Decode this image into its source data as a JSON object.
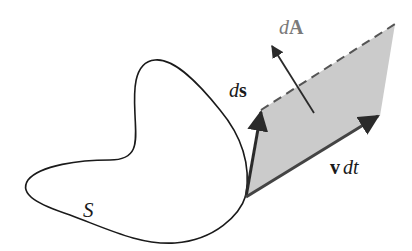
{
  "diagram": {
    "surface_label": "S",
    "ds_label_d": "d",
    "ds_label_vec": "s",
    "dA_label_d": "d",
    "dA_label_vec": "A",
    "vdt_label_vec": "v",
    "vdt_label_rest": "dt",
    "colors": {
      "stroke": "#1a1a1a",
      "fill": "#c8c8c8",
      "arrow": "#333333",
      "dA_text": "#7a7a7a"
    }
  }
}
